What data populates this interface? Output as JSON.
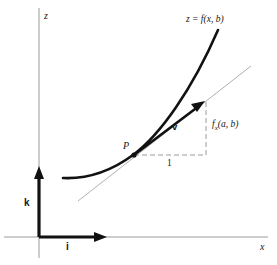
{
  "figure": {
    "kind": "math-diagram",
    "background_color": "#ffffff",
    "ink_color": "#121212",
    "guide_color": "#9a9a9a"
  },
  "axes": {
    "vertical": {
      "name": "z-axis",
      "label": "z"
    },
    "horizontal": {
      "name": "x-axis",
      "label": "x"
    }
  },
  "basis_vectors": [
    {
      "name": "k-vector",
      "label": "k",
      "direction": "up-along-z"
    },
    {
      "name": "i-vector",
      "label": "i",
      "direction": "right-along-x"
    }
  ],
  "curve": {
    "name": "trace-curve",
    "label": "z = f(x, b)"
  },
  "tangent": {
    "name": "tangent-line",
    "label": ""
  },
  "point": {
    "name": "point-P",
    "label": "P"
  },
  "vector": {
    "name": "direction-vector-v",
    "label": "v"
  },
  "slope_triangle": {
    "run_label": "1",
    "rise_label_parts": {
      "f": "f",
      "subscript": "x",
      "args": "(a, b)"
    },
    "rise_label": "f x (a, b)"
  }
}
